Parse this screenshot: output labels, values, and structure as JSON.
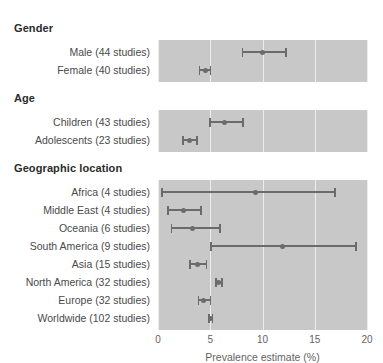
{
  "chart_data": {
    "type": "scatter",
    "title": "",
    "xlabel": "Prevalence estimate (%)",
    "ylabel": "",
    "xlim": [
      0,
      20
    ],
    "xticks": [
      0,
      5,
      10,
      15,
      20
    ],
    "xtick_labels": [
      "0",
      "5",
      "10",
      "15",
      "20"
    ],
    "grid": true,
    "legend": "none",
    "orientation": "horizontal-forest-plot",
    "panel_background": "#c8c8c8",
    "gridline_color": "#ededed",
    "marker_color": "#6b6b6b",
    "groups": [
      {
        "header": "Gender",
        "rows": [
          {
            "label": "Male (44 studies)",
            "estimate": 10.0,
            "ci_low": 8.0,
            "ci_high": 12.3
          },
          {
            "label": "Female (40 studies)",
            "estimate": 4.5,
            "ci_low": 3.9,
            "ci_high": 5.1
          }
        ]
      },
      {
        "header": "Age",
        "rows": [
          {
            "label": "Children (43 studies)",
            "estimate": 6.4,
            "ci_low": 4.9,
            "ci_high": 8.2
          },
          {
            "label": "Adolescents (23 studies)",
            "estimate": 3.0,
            "ci_low": 2.3,
            "ci_high": 3.8
          }
        ]
      },
      {
        "header": "Geographic location",
        "rows": [
          {
            "label": "Africa (4 studies)",
            "estimate": 9.3,
            "ci_low": 0.3,
            "ci_high": 17.0
          },
          {
            "label": "Middle East (4 studies)",
            "estimate": 2.4,
            "ci_low": 0.9,
            "ci_high": 4.2
          },
          {
            "label": "Oceania (6 studies)",
            "estimate": 3.3,
            "ci_low": 1.2,
            "ci_high": 6.0
          },
          {
            "label": "South America (9 studies)",
            "estimate": 11.9,
            "ci_low": 5.0,
            "ci_high": 19.0
          },
          {
            "label": "Asia (15 studies)",
            "estimate": 3.8,
            "ci_low": 3.0,
            "ci_high": 4.7
          },
          {
            "label": "North America (32 studies)",
            "estimate": 5.8,
            "ci_low": 5.5,
            "ci_high": 6.2
          },
          {
            "label": "Europe (32 studies)",
            "estimate": 4.4,
            "ci_low": 3.8,
            "ci_high": 5.1
          },
          {
            "label": "Worldwide (102 studies)",
            "estimate": 5.0,
            "ci_low": 4.8,
            "ci_high": 5.3
          }
        ]
      }
    ]
  }
}
